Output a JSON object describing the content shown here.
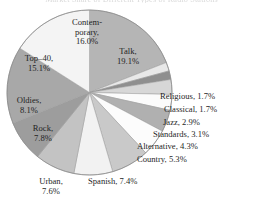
{
  "title": "Market Share of Different Types of Radio Stations",
  "chart_data": {
    "type": "pie",
    "title": "Market Share of Different Types of Radio Stations",
    "xlabel": "",
    "ylabel": "",
    "units": "percent",
    "start_angle_deg": 0,
    "direction": "clockwise",
    "legend": "none",
    "labels_position": "around-pie",
    "categories": [
      "Talk",
      "Religious",
      "Classical",
      "Jazz",
      "Standards",
      "Alternative",
      "Country",
      "Spanish",
      "Urban",
      "Rock",
      "Oldies",
      "Top-40",
      "Contemporary"
    ],
    "values": [
      19.1,
      1.7,
      1.7,
      2.9,
      3.1,
      4.3,
      5.3,
      7.4,
      7.6,
      7.8,
      8.1,
      15.1,
      16.0
    ],
    "slices": [
      {
        "name": "Talk",
        "value": 19.1,
        "label": "Talk,",
        "pct_text": "19.1%",
        "color": "#b5b5b5",
        "label_mode": "inside",
        "label_id": "label-talk"
      },
      {
        "name": "Religious",
        "value": 1.7,
        "label": "Religious,",
        "pct_text": "1.7%",
        "color": "#e8e8e8",
        "label_mode": "outside",
        "label_id": "label-religious"
      },
      {
        "name": "Classical",
        "value": 1.7,
        "label": "Classical,",
        "pct_text": "1.7%",
        "color": "#8f8f8f",
        "label_mode": "outside",
        "label_id": "label-classical"
      },
      {
        "name": "Jazz",
        "value": 2.9,
        "label": "Jazz,",
        "pct_text": "2.9%",
        "color": "#d7d7d7",
        "label_mode": "outside",
        "label_id": "label-jazz"
      },
      {
        "name": "Standards",
        "value": 3.1,
        "label": "Standards,",
        "pct_text": "3.1%",
        "color": "#fbfbfb",
        "label_mode": "outside",
        "label_id": "label-standards"
      },
      {
        "name": "Alternative",
        "value": 4.3,
        "label": "Alternative,",
        "pct_text": "4.3%",
        "color": "#b0b0b0",
        "label_mode": "outside",
        "label_id": "label-alternative"
      },
      {
        "name": "Country",
        "value": 5.3,
        "label": "Country,",
        "pct_text": "5.3%",
        "color": "#fcfcfc",
        "label_mode": "outside",
        "label_id": "label-country"
      },
      {
        "name": "Spanish",
        "value": 7.4,
        "label": "Spanish,",
        "pct_text": "7.4%",
        "color": "#c9c9c9",
        "label_mode": "outside",
        "label_id": "label-spanish"
      },
      {
        "name": "Urban",
        "value": 7.6,
        "label": "Urban,",
        "pct_text": "7.6%",
        "color": "#f2f2f2",
        "label_mode": "outside",
        "label_id": "label-urban"
      },
      {
        "name": "Rock",
        "value": 7.8,
        "label": "Rock,",
        "pct_text": "7.8%",
        "color": "#c3c3c3",
        "label_mode": "inside",
        "label_id": "label-rock"
      },
      {
        "name": "Oldies",
        "value": 8.1,
        "label": "Oldies,",
        "pct_text": "8.1%",
        "color": "#9d9d9d",
        "label_mode": "inside",
        "label_id": "label-oldies"
      },
      {
        "name": "Top-40",
        "value": 15.1,
        "label": "Top–40,",
        "pct_text": "15.1%",
        "color": "#a8a8a8",
        "label_mode": "inside",
        "label_id": "label-top40"
      },
      {
        "name": "Contemporary",
        "value": 16.0,
        "label": "Contem-",
        "label2": "porary,",
        "pct_text": "16.0%",
        "color": "#f4f4f4",
        "label_mode": "inside",
        "label_id": "label-contemporary"
      }
    ]
  },
  "labels": {
    "contemporary_line1": "Contem-",
    "contemporary_line2": "porary,",
    "contemporary_pct": "16.0%",
    "talk_name": "Talk,",
    "talk_pct": "19.1%",
    "top40_name": "Top–40,",
    "top40_pct": "15.1%",
    "oldies_name": "Oldies,",
    "oldies_pct": "8.1%",
    "rock_name": "Rock,",
    "rock_pct": "7.8%",
    "urban_name": "Urban,",
    "urban_pct": "7.6%",
    "spanish_full": "Spanish, 7.4%",
    "country_full": "Country, 5.3%",
    "alternative_full": "Alternative, 4.3%",
    "standards_full": "Standards, 3.1%",
    "jazz_full": "Jazz, 2.9%",
    "classical_full": "Classical, 1.7%",
    "religious_full": "Religious, 1.7%"
  },
  "colors": {
    "background": "#ffffff",
    "text": "#1f1f1f",
    "outline": "#8a8a8a"
  }
}
